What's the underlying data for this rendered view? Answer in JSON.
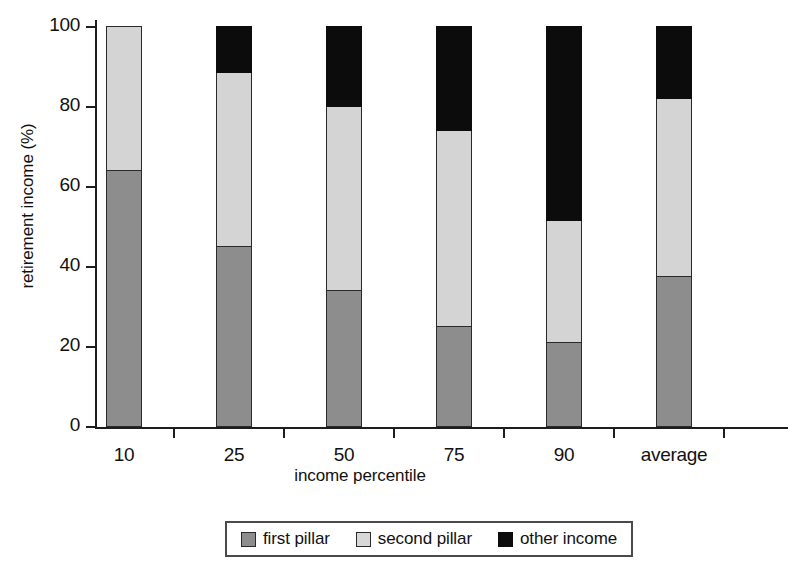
{
  "chart_data": {
    "type": "bar",
    "stacked": true,
    "title": "",
    "xlabel": "income percentile",
    "ylabel": "retirement income (%)",
    "categories": [
      "10",
      "25",
      "50",
      "75",
      "90",
      "average"
    ],
    "series": [
      {
        "name": "first pillar",
        "color": "#8d8d8d",
        "values": [
          64,
          45,
          34,
          25,
          21,
          37.5
        ]
      },
      {
        "name": "second pillar",
        "color": "#d4d4d4",
        "values": [
          36,
          43.5,
          46,
          49,
          30.5,
          44.5
        ]
      },
      {
        "name": "other income",
        "color": "#0c0c0c",
        "values": [
          0,
          11.5,
          20,
          26,
          48.5,
          18
        ]
      }
    ],
    "ylim": [
      0,
      100
    ],
    "yticks": [
      0,
      20,
      40,
      60,
      80,
      100
    ],
    "ytick_labels": [
      "0",
      "20",
      "40",
      "60",
      "80",
      "100"
    ],
    "grid": false,
    "legend_position": "bottom"
  },
  "legend": {
    "entries": [
      {
        "label": "first pillar"
      },
      {
        "label": "second pillar"
      },
      {
        "label": "other income"
      }
    ]
  }
}
